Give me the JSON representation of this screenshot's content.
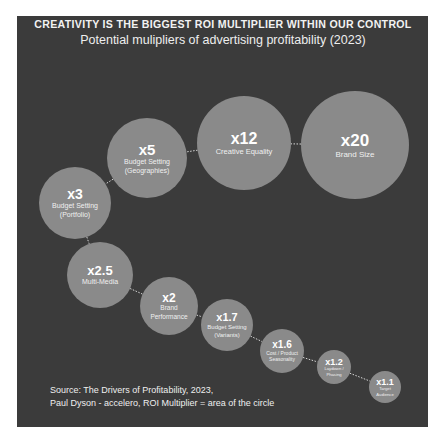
{
  "header": {
    "title": "CREATIVITY IS THE BIGGEST ROI MULTIPLIER WITHIN OUR CONTROL",
    "subtitle": "Potential mulipliers of advertising profitability (2023)"
  },
  "footer": {
    "source_line1": "Source: The Drivers of Profitability, 2023,",
    "source_line2": "Paul Dyson - accelero, ROI Multiplier = area of the circle"
  },
  "colors": {
    "background": "#3b3b3b",
    "bubble": "#8a8a8a",
    "text": "#ffffff",
    "connector": "#d8d8d8"
  },
  "chart_data": {
    "type": "bubble",
    "title": "CREATIVITY IS THE BIGGEST ROI MULTIPLIER WITHIN OUR CONTROL",
    "subtitle": "Potential mulipliers of advertising profitability (2023)",
    "note": "ROI Multiplier = area of the circle",
    "categories": [
      "Brand Size",
      "Creative Equality",
      "Budget Setting (Geographies)",
      "Budget Setting (Portfolio)",
      "Multi-Media",
      "Brand Performance",
      "Budget Setting (Variants)",
      "Cost / Product Seasonality",
      "Laydown / Phasing",
      "Target Audience"
    ],
    "values": [
      20,
      12,
      5,
      3,
      2.5,
      2,
      1.7,
      1.6,
      1.2,
      1.1
    ],
    "bubbles": [
      {
        "value_label": "x20",
        "value": 20,
        "label_lines": [
          "Brand Size"
        ],
        "cx": 355,
        "cy": 145,
        "r": 54,
        "vsize": 17,
        "lsize": 8
      },
      {
        "value_label": "x12",
        "value": 12,
        "label_lines": [
          "Creative Equality"
        ],
        "cx": 244,
        "cy": 143,
        "r": 47,
        "vsize": 16,
        "lsize": 7.5
      },
      {
        "value_label": "x5",
        "value": 5,
        "label_lines": [
          "Budget Setting",
          "(Geographies)"
        ],
        "cx": 147,
        "cy": 158,
        "r": 40,
        "vsize": 15,
        "lsize": 7
      },
      {
        "value_label": "x3",
        "value": 3,
        "label_lines": [
          "Budget Setting",
          "(Portfolio)"
        ],
        "cx": 75,
        "cy": 203,
        "r": 36,
        "vsize": 14,
        "lsize": 7
      },
      {
        "value_label": "x2.5",
        "value": 2.5,
        "label_lines": [
          "Multi-Media"
        ],
        "cx": 100,
        "cy": 275,
        "r": 33,
        "vsize": 13,
        "lsize": 7
      },
      {
        "value_label": "x2",
        "value": 2,
        "label_lines": [
          "Brand",
          "Performance"
        ],
        "cx": 169,
        "cy": 306,
        "r": 29,
        "vsize": 12,
        "lsize": 6.5
      },
      {
        "value_label": "x1.7",
        "value": 1.7,
        "label_lines": [
          "Budget Setting",
          "(Variants)"
        ],
        "cx": 227,
        "cy": 325,
        "r": 26,
        "vsize": 11,
        "lsize": 6
      },
      {
        "value_label": "x1.6",
        "value": 1.6,
        "label_lines": [
          "Cost / Product",
          "Seasonality"
        ],
        "cx": 282,
        "cy": 351,
        "r": 22,
        "vsize": 10,
        "lsize": 5
      },
      {
        "value_label": "x1.2",
        "value": 1.2,
        "label_lines": [
          "Laydown /",
          "Phasing"
        ],
        "cx": 334,
        "cy": 367,
        "r": 17,
        "vsize": 9,
        "lsize": 4.2
      },
      {
        "value_label": "x1.1",
        "value": 1.1,
        "label_lines": [
          "Target",
          "Audience"
        ],
        "cx": 385,
        "cy": 387,
        "r": 16,
        "vsize": 9,
        "lsize": 4.2
      }
    ],
    "source": "Source: The Drivers of Profitability, 2023, Paul Dyson - accelero"
  }
}
